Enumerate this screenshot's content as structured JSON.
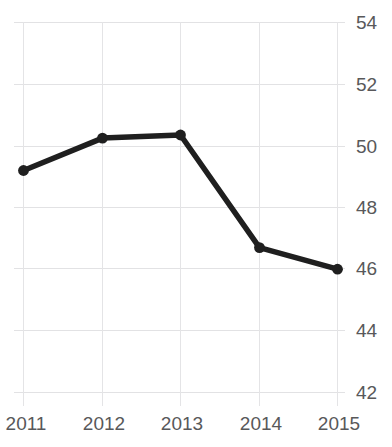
{
  "chart_data": {
    "type": "line",
    "title": "",
    "xlabel": "",
    "ylabel": "",
    "categories": [
      "2011",
      "2012",
      "2013",
      "2014",
      "2015"
    ],
    "values": [
      49.2,
      50.25,
      50.35,
      46.7,
      46.0
    ],
    "series": [
      {
        "name": "series-1",
        "values": [
          49.2,
          50.25,
          50.35,
          46.7,
          46.0
        ],
        "color": "#1f1f1f",
        "marker": "circle"
      }
    ],
    "x_tick_labels": [
      "2011",
      "2012",
      "2013",
      "2014",
      "2015"
    ],
    "y_tick_labels": [
      "54",
      "52",
      "50",
      "48",
      "46",
      "44",
      "42"
    ],
    "y_ticks": [
      54,
      52,
      50,
      48,
      46,
      44,
      42
    ],
    "ylim": [
      42,
      54
    ],
    "xlim": [
      2011,
      2015
    ],
    "grid": true,
    "grid_color": "#e2e2e4",
    "y_axis_position": "right",
    "legend": "none",
    "background_color": "#ffffff",
    "label_color": "#58585a",
    "annotations": []
  },
  "axes": {
    "y_labels": [
      "54",
      "52",
      "50",
      "48",
      "46",
      "44",
      "42"
    ],
    "x_labels": [
      "2011",
      "2012",
      "2013",
      "2014",
      "2015"
    ]
  },
  "title_sliver": "·························"
}
